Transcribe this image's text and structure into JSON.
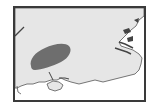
{
  "map": {
    "subject": "South-east England coastline with highlighted region",
    "colors": {
      "frame": "#3a3a3a",
      "land": "#e6e6e6",
      "sea": "#ffffff",
      "coastline": "#555555",
      "highlight_region": "#6e6e6e",
      "estuary_detail": "#444444"
    },
    "features": [
      {
        "name": "highlighted-region",
        "type": "shaded-area"
      },
      {
        "name": "isle-of-wight",
        "type": "island"
      },
      {
        "name": "thames-estuary",
        "type": "estuary"
      },
      {
        "name": "south-coast",
        "type": "coastline"
      }
    ]
  }
}
